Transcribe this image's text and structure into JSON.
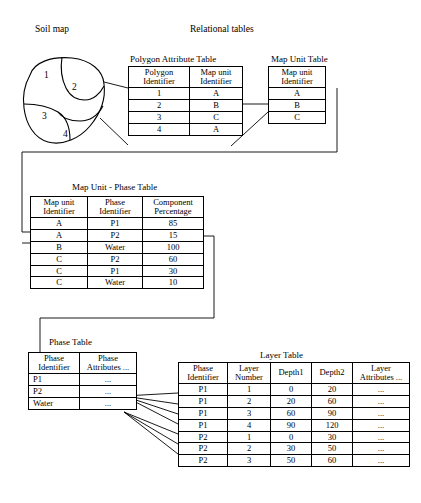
{
  "labels": {
    "soil_map": "Soil map",
    "relational_tables": "Relational tables"
  },
  "soil_map": {
    "polygon_numbers": [
      "1",
      "2",
      "3",
      "4"
    ]
  },
  "tables": [
    {
      "id": "polygon-attribute-table",
      "title": "Polygon Attribute Table",
      "headers": [
        "Polygon\nIdentifier",
        "Map unit\nIdentifier"
      ],
      "header_lines": [
        [
          "Polygon",
          "Identifier"
        ],
        [
          "Map unit",
          "Identifier"
        ]
      ],
      "rows": [
        [
          "1",
          "A"
        ],
        [
          "2",
          "B"
        ],
        [
          "3",
          "C"
        ],
        [
          "4",
          "A"
        ]
      ]
    },
    {
      "id": "map-unit-table",
      "title": "Map Unit Table",
      "header_lines": [
        [
          "Map unit",
          "Identifier"
        ]
      ],
      "rows": [
        [
          "A"
        ],
        [
          "B"
        ],
        [
          "C"
        ]
      ]
    },
    {
      "id": "map-unit-phase-table",
      "title": "Map Unit - Phase Table",
      "header_lines": [
        [
          "Map unit",
          "Identifier"
        ],
        [
          "Phase",
          "Identifier"
        ],
        [
          "Component",
          "Percentage"
        ]
      ],
      "rows": [
        [
          "A",
          "P1",
          "85"
        ],
        [
          "A",
          "P2",
          "15"
        ],
        [
          "B",
          "Water",
          "100"
        ],
        [
          "C",
          "P2",
          "60"
        ],
        [
          "C",
          "P1",
          "30"
        ],
        [
          "C",
          "Water",
          "10"
        ]
      ]
    },
    {
      "id": "phase-table",
      "title": "Phase Table",
      "header_lines": [
        [
          "Phase",
          "Identifier"
        ],
        [
          "Phase",
          "Attributes ..."
        ]
      ],
      "rows": [
        [
          "P1",
          "..."
        ],
        [
          "P2",
          "..."
        ],
        [
          "Water",
          "..."
        ]
      ]
    },
    {
      "id": "layer-table",
      "title": "Layer Table",
      "header_lines": [
        [
          "Phase",
          "Identifier"
        ],
        [
          "Layer",
          "Number"
        ],
        [
          "Depth1"
        ],
        [
          "Depth2"
        ],
        [
          "Layer",
          "Attributes ..."
        ]
      ],
      "rows": [
        [
          "P1",
          "1",
          "0",
          "20",
          "..."
        ],
        [
          "P1",
          "2",
          "20",
          "60",
          "..."
        ],
        [
          "P1",
          "3",
          "60",
          "90",
          "..."
        ],
        [
          "P1",
          "4",
          "90",
          "120",
          "..."
        ],
        [
          "P2",
          "1",
          "0",
          "30",
          "..."
        ],
        [
          "P2",
          "2",
          "30",
          "50",
          "..."
        ],
        [
          "P2",
          "3",
          "50",
          "60",
          "..."
        ]
      ]
    }
  ]
}
